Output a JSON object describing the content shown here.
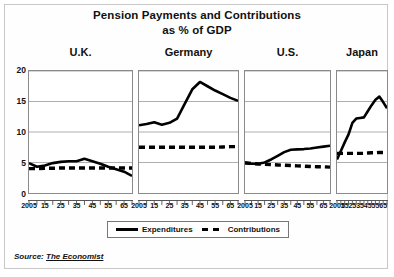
{
  "figure": {
    "title_line1": "Pension Payments and Contributions",
    "title_line2": "as % of GDP",
    "source_label": "Source:",
    "source_name": "The Economist"
  },
  "legend": {
    "position": "bottom-center",
    "items": [
      {
        "label": "Expenditures",
        "style": "solid",
        "color": "#000000"
      },
      {
        "label": "Contributions",
        "style": "dashed",
        "color": "#000000"
      }
    ]
  },
  "axis": {
    "ylabel": "",
    "xlabel": "",
    "yticks": [
      20,
      15,
      10,
      5,
      0
    ],
    "ylim": [
      0,
      20
    ],
    "xticks_labeled": [
      "2005",
      "15",
      "25",
      "35",
      "45",
      "55",
      "65"
    ],
    "xlim": [
      2005,
      2070
    ],
    "grid": true
  },
  "chart_data": {
    "type": "line",
    "title": "Pension Payments and Contributions as % of GDP",
    "xlabel": "",
    "ylabel": "% of GDP",
    "ylim": [
      0,
      20
    ],
    "xlim": [
      2005,
      2070
    ],
    "grid": true,
    "legend_position": "bottom-center",
    "x": [
      2005,
      2010,
      2015,
      2020,
      2025,
      2030,
      2035,
      2040,
      2045,
      2050,
      2055,
      2060,
      2065,
      2070
    ],
    "panels": [
      {
        "name": "U.K.",
        "series": [
          {
            "name": "Expenditures",
            "style": "solid",
            "values": [
              4.9,
              4.3,
              4.5,
              4.9,
              5.1,
              5.2,
              5.2,
              5.6,
              5.2,
              4.8,
              4.3,
              3.9,
              3.5,
              2.8
            ]
          },
          {
            "name": "Contributions",
            "style": "dashed",
            "values": [
              4.0,
              4.0,
              4.05,
              4.05,
              4.1,
              4.1,
              4.1,
              4.1,
              4.1,
              4.1,
              4.1,
              4.1,
              4.1,
              4.1
            ]
          }
        ]
      },
      {
        "name": "Germany",
        "series": [
          {
            "name": "Expenditures",
            "style": "solid",
            "values": [
              11.1,
              11.3,
              11.6,
              11.2,
              11.5,
              12.2,
              14.6,
              17.0,
              18.2,
              17.5,
              16.8,
              16.2,
              15.6,
              15.1
            ]
          },
          {
            "name": "Contributions",
            "style": "dashed",
            "values": [
              7.5,
              7.5,
              7.5,
              7.5,
              7.5,
              7.5,
              7.5,
              7.5,
              7.5,
              7.5,
              7.5,
              7.55,
              7.6,
              7.6
            ]
          }
        ]
      },
      {
        "name": "U.S.",
        "series": [
          {
            "name": "Expenditures",
            "style": "solid",
            "values": [
              4.9,
              4.8,
              4.8,
              5.0,
              5.5,
              6.1,
              6.7,
              7.1,
              7.15,
              7.2,
              7.3,
              7.45,
              7.6,
              7.75
            ]
          },
          {
            "name": "Contributions",
            "style": "dashed",
            "values": [
              4.95,
              4.85,
              4.75,
              4.7,
              4.65,
              4.6,
              4.55,
              4.5,
              4.45,
              4.4,
              4.35,
              4.3,
              4.3,
              4.25
            ]
          }
        ]
      },
      {
        "name": "Japan",
        "series": [
          {
            "name": "Expenditures",
            "style": "solid",
            "values": [
              5.5,
              6.9,
              8.3,
              9.6,
              11.5,
              12.2,
              12.3,
              12.4,
              13.4,
              14.4,
              15.3,
              15.8,
              14.9,
              13.9
            ]
          },
          {
            "name": "Contributions",
            "style": "dashed",
            "values": [
              6.5,
              6.5,
              6.5,
              6.5,
              6.5,
              6.5,
              6.5,
              6.5,
              6.55,
              6.6,
              6.6,
              6.65,
              6.65,
              6.7
            ]
          }
        ]
      }
    ]
  }
}
